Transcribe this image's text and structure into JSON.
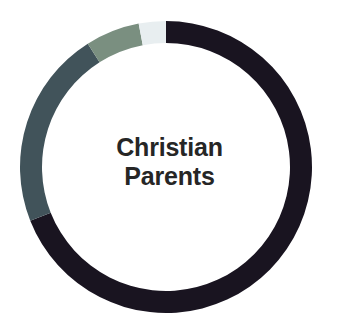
{
  "figure": {
    "background_color": "#ffffff",
    "center_label_color": "#262626"
  },
  "center_label": {
    "line1": "Christian",
    "line2": "Parents"
  },
  "chart_data": {
    "type": "pie",
    "variant": "donut",
    "title": "Christian Parents",
    "xlabel": "",
    "ylabel": "",
    "grid": false,
    "legend": "none",
    "center_text": "Christian Parents",
    "units": "percent",
    "start_angle_deg": 0,
    "direction": "clockwise",
    "center_x": 166,
    "center_y": 167,
    "outer_radius": 146,
    "inner_radius": 124,
    "categories": [
      "Segment 1",
      "Segment 2",
      "Segment 3",
      "Segment 4"
    ],
    "values": [
      69,
      22,
      6,
      3
    ],
    "colors": [
      "#191420",
      "#41535a",
      "#7a8f80",
      "#e8eef0"
    ],
    "segments": [
      {
        "name": "Segment 1",
        "value": 69,
        "color": "#191420",
        "start_angle_deg": 0,
        "end_angle_deg": 248.4
      },
      {
        "name": "Segment 2",
        "value": 22,
        "color": "#41535a",
        "start_angle_deg": 248.4,
        "end_angle_deg": 327.6
      },
      {
        "name": "Segment 3",
        "value": 6,
        "color": "#7a8f80",
        "start_angle_deg": 327.6,
        "end_angle_deg": 349.2
      },
      {
        "name": "Segment 4",
        "value": 3,
        "color": "#e8eef0",
        "start_angle_deg": 349.2,
        "end_angle_deg": 360
      }
    ]
  }
}
